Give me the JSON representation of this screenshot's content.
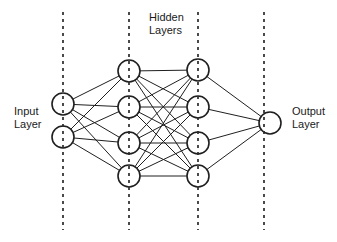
{
  "diagram": {
    "type": "neural-network",
    "background_color": "#ffffff",
    "stroke_color": "#1f1f1f",
    "node_fill_color": "#ffffff",
    "divider_color": "#2b2b2b",
    "text_color": "#1a1a1a",
    "width": 337,
    "height": 242
  },
  "labels": {
    "input": "Input\nLayer",
    "hidden": "Hidden\nLayers",
    "output": "Output\nLayer"
  },
  "dividers": [
    {
      "name": "divider-input-boundary",
      "x": 63,
      "y1": 12,
      "y2": 230
    },
    {
      "name": "divider-hidden1-boundary",
      "x": 129,
      "y1": 12,
      "y2": 230
    },
    {
      "name": "divider-hidden2-boundary",
      "x": 198,
      "y1": 12,
      "y2": 230
    },
    {
      "name": "divider-output-boundary",
      "x": 264,
      "y1": 12,
      "y2": 230
    }
  ],
  "layers": [
    {
      "name": "input-layer",
      "label": "Input Layer",
      "x": 63,
      "node_count": 2,
      "node_radius": 11,
      "nodes": [
        {
          "id": "i1",
          "cx": 63,
          "cy": 104
        },
        {
          "id": "i2",
          "cx": 63,
          "cy": 137
        }
      ]
    },
    {
      "name": "hidden-layer-1",
      "label": "Hidden Layer 1",
      "x": 129,
      "node_count": 4,
      "node_radius": 11,
      "nodes": [
        {
          "id": "h1_1",
          "cx": 129,
          "cy": 71
        },
        {
          "id": "h1_2",
          "cx": 129,
          "cy": 107
        },
        {
          "id": "h1_3",
          "cx": 129,
          "cy": 143
        },
        {
          "id": "h1_4",
          "cx": 129,
          "cy": 176
        }
      ]
    },
    {
      "name": "hidden-layer-2",
      "label": "Hidden Layer 2",
      "x": 198,
      "node_count": 4,
      "node_radius": 11,
      "nodes": [
        {
          "id": "h2_1",
          "cx": 198,
          "cy": 70
        },
        {
          "id": "h2_2",
          "cx": 198,
          "cy": 107
        },
        {
          "id": "h2_3",
          "cx": 198,
          "cy": 143
        },
        {
          "id": "h2_4",
          "cx": 198,
          "cy": 176
        }
      ]
    },
    {
      "name": "output-layer",
      "label": "Output Layer",
      "x": 270,
      "node_count": 1,
      "node_radius": 11,
      "nodes": [
        {
          "id": "o1",
          "cx": 270,
          "cy": 123
        }
      ]
    }
  ],
  "connections": {
    "style": "fully-connected",
    "pairs": [
      [
        "input-layer",
        "hidden-layer-1"
      ],
      [
        "hidden-layer-1",
        "hidden-layer-2"
      ],
      [
        "hidden-layer-2",
        "output-layer"
      ]
    ]
  }
}
